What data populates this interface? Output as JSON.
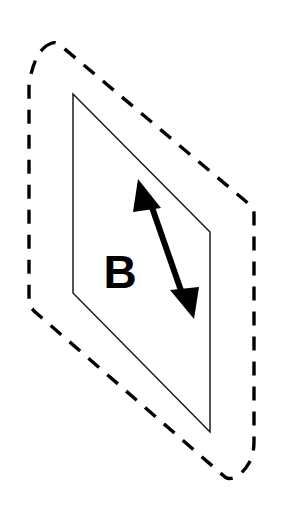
{
  "figure": {
    "background_color": "#ffffff",
    "canvas": {
      "width": 285,
      "height": 518
    },
    "label": {
      "text": "B",
      "color": "#000000",
      "x": 120,
      "y": 276,
      "font_size": 46,
      "font_weight": "bold"
    },
    "dashed_boundary": {
      "name": "dashed-region-outline",
      "color": "#000000",
      "stroke_width": 3.4,
      "dash_pattern": "14 11",
      "line_cap": "butt",
      "path": "M 52 43 C 40 47 32 62 29 86 L 29 303 C 29 307 31 307 34 311 L 225 477 C 232 482 243 474 249 463 C 253 456 254 449 254 441 L 254 214 C 254 209 252 207 249 204 L 60 45 C 57 43 55 42 52 43 Z",
      "vertices": [
        {
          "x": 52,
          "y": 43
        },
        {
          "x": 29,
          "y": 86
        },
        {
          "x": 29,
          "y": 303
        },
        {
          "x": 225,
          "y": 477
        },
        {
          "x": 254,
          "y": 441
        },
        {
          "x": 254,
          "y": 214
        }
      ]
    },
    "inner_plane": {
      "name": "plane-b-parallelogram",
      "stroke_color": "#1a1a1a",
      "fill_color": "#ffffff",
      "stroke_width": 1.5,
      "points": "73,94 210,232 210,432 73,293",
      "vertices": [
        {
          "x": 73,
          "y": 94
        },
        {
          "x": 210,
          "y": 232
        },
        {
          "x": 210,
          "y": 432
        },
        {
          "x": 73,
          "y": 293
        }
      ]
    },
    "arrow": {
      "name": "double-headed-direction-arrow",
      "color": "#000000",
      "shaft_width": 6,
      "shaft": {
        "x1": 148,
        "y1": 196,
        "x2": 185,
        "y2": 302
      },
      "head_start": {
        "tip": {
          "x": 138,
          "y": 179
        },
        "points": "138,179 161,208 133,212"
      },
      "head_end": {
        "tip": {
          "x": 194,
          "y": 319
        },
        "points": "194,319 170,290 199,287"
      },
      "double_headed": true
    }
  }
}
